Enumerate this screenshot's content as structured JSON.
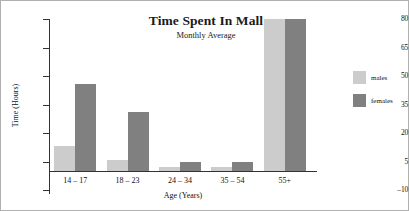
{
  "chart_data": {
    "type": "bar",
    "title": "Time Spent In Mall",
    "subtitle": "Monthly Average",
    "xlabel": "Age (Years)",
    "ylabel": "Time (Hours)",
    "categories": [
      "14 – 17",
      "18 – 23",
      "24 – 34",
      "35 – 54",
      "55+"
    ],
    "series": [
      {
        "name": "males",
        "color": "#cccccc",
        "values": [
          13,
          6,
          2,
          2,
          80
        ]
      },
      {
        "name": "females",
        "color": "#808080",
        "values": [
          46,
          31,
          5,
          5,
          80
        ]
      }
    ],
    "ylim": [
      -10,
      80
    ],
    "yticks": [
      80,
      65,
      50,
      35,
      20,
      5,
      -10
    ],
    "ytick_labels": [
      "80",
      "65",
      "50",
      "35",
      "20",
      "5",
      "–10"
    ],
    "grid": false,
    "legend_position": "right"
  },
  "legend": {
    "items": [
      {
        "label": "males"
      },
      {
        "label": "females"
      }
    ]
  }
}
